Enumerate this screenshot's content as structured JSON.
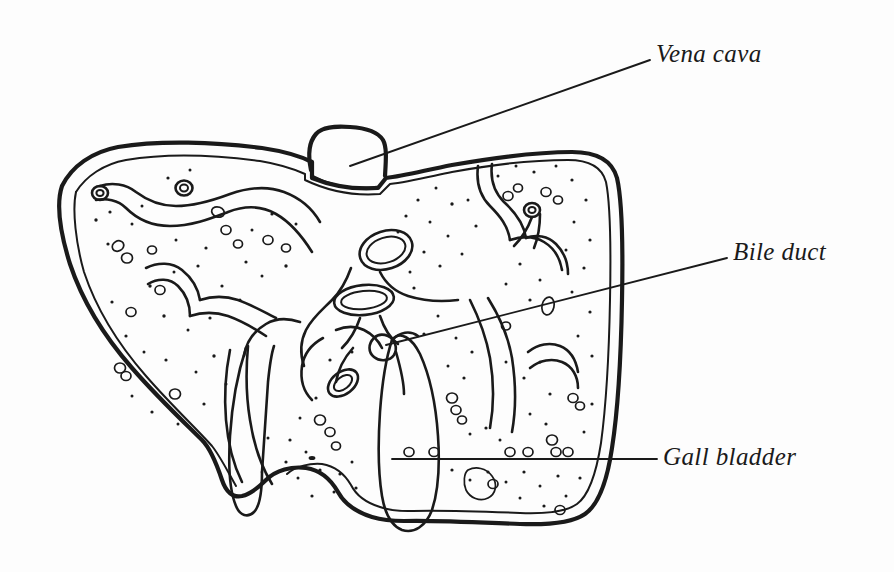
{
  "figure": {
    "style": "black ink line drawing with stippling on white background",
    "width": 894,
    "height": 572,
    "background_color": "#fdfdfd",
    "ink_color": "#1a1a1a"
  },
  "labels": [
    {
      "id": "vena-cava",
      "text": "Vena cava",
      "x": 656,
      "y": 40,
      "leader_line": {
        "from_x": 650,
        "from_y": 60,
        "to_x": 350,
        "to_y": 166
      }
    },
    {
      "id": "bile-duct",
      "text": "Bile duct",
      "x": 733,
      "y": 238,
      "leader_line": {
        "from_x": 727,
        "from_y": 258,
        "to_x": 386,
        "to_y": 345
      }
    },
    {
      "id": "gall-bladder",
      "text": "Gall bladder",
      "x": 663,
      "y": 443,
      "leader_line": {
        "from_x": 657,
        "from_y": 459,
        "to_x": 392,
        "to_y": 459
      }
    }
  ],
  "structures": {
    "liver_outline": "double-contour lobed organ silhouette spanning x 45-625, y 140-525",
    "vena_cava_stub": "rounded rectangular vessel stub protruding from superior border near x 310-385, y 128-182",
    "vena_cava_lumen": "oval cross-section inside right of hilum",
    "portal_vein_lumen": "oval cross-section at centre of hilum",
    "bile_duct_lumen": "small oval cross-section below hilum",
    "gall_bladder": "elongated pear-shaped sac hanging from inferior surface centre",
    "caudate_tongue": "narrow tongue-shaped lobe projecting below left of gall bladder",
    "vessel_branches": "branching hepatic vessel channels drawn as paired outlines through both lobes",
    "stippling": "fine dot texture representing parenchyma throughout the section"
  }
}
